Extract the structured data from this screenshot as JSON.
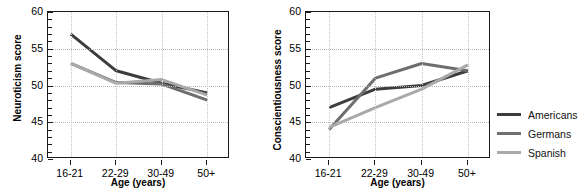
{
  "chart_data": [
    {
      "type": "line",
      "title": "",
      "panel": "left",
      "xlabel": "Age (years)",
      "ylabel": "Neuroticism score",
      "categories": [
        "16-21",
        "22-29",
        "30-49",
        "50+"
      ],
      "ylim": [
        40,
        60
      ],
      "yticks": [
        40,
        45,
        50,
        55,
        60
      ],
      "grid": true,
      "legend_position": "right-outside",
      "series": [
        {
          "name": "Americans",
          "color": "#3c3c3c",
          "values": [
            57.0,
            52.0,
            50.3,
            49.0
          ]
        },
        {
          "name": "Germans",
          "color": "#6e6e6e",
          "values": [
            53.0,
            50.4,
            50.2,
            48.0
          ]
        },
        {
          "name": "Spanish",
          "color": "#a9a9a9",
          "values": [
            53.0,
            50.3,
            50.8,
            48.7
          ]
        }
      ]
    },
    {
      "type": "line",
      "title": "",
      "panel": "right",
      "xlabel": "Age (years)",
      "ylabel": "Conscientiousness score",
      "categories": [
        "16-21",
        "22-29",
        "30-49",
        "50+"
      ],
      "ylim": [
        40,
        60
      ],
      "yticks": [
        40,
        45,
        50,
        55,
        60
      ],
      "grid": true,
      "legend_position": "right-outside",
      "series": [
        {
          "name": "Americans",
          "color": "#3c3c3c",
          "values": [
            47.0,
            49.5,
            50.0,
            52.0
          ]
        },
        {
          "name": "Germans",
          "color": "#6e6e6e",
          "values": [
            44.0,
            51.0,
            53.0,
            52.0
          ]
        },
        {
          "name": "Spanish",
          "color": "#a9a9a9",
          "values": [
            44.3,
            47.0,
            49.5,
            52.8
          ]
        }
      ]
    }
  ],
  "legend": {
    "items": [
      {
        "label": "Americans",
        "color": "#3c3c3c"
      },
      {
        "label": "Germans",
        "color": "#6e6e6e"
      },
      {
        "label": "Spanish",
        "color": "#a9a9a9"
      }
    ]
  }
}
